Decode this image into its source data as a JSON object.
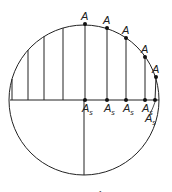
{
  "figure": {
    "caption": "Fig. 2.1",
    "circle": {
      "cx": 84,
      "cy": 100,
      "r": 75
    },
    "top_points": [
      {
        "label": "A",
        "x": 85,
        "y": 24
      },
      {
        "label": "A",
        "x": 107,
        "y": 28
      },
      {
        "label": "A",
        "x": 126,
        "y": 38
      },
      {
        "label": "A",
        "x": 145,
        "y": 57
      },
      {
        "label": "A",
        "x": 156,
        "y": 77
      }
    ],
    "base_points": [
      {
        "label": "A",
        "sub": "s",
        "x": 85
      },
      {
        "label": "A",
        "sub": "s",
        "x": 107
      },
      {
        "label": "A",
        "sub": "s",
        "x": 126
      },
      {
        "label": "A",
        "sub": "s",
        "x": 145
      },
      {
        "label": "A",
        "sub": "s",
        "x": 155
      }
    ],
    "left_lines_x": [
      12,
      28,
      44,
      63
    ]
  }
}
